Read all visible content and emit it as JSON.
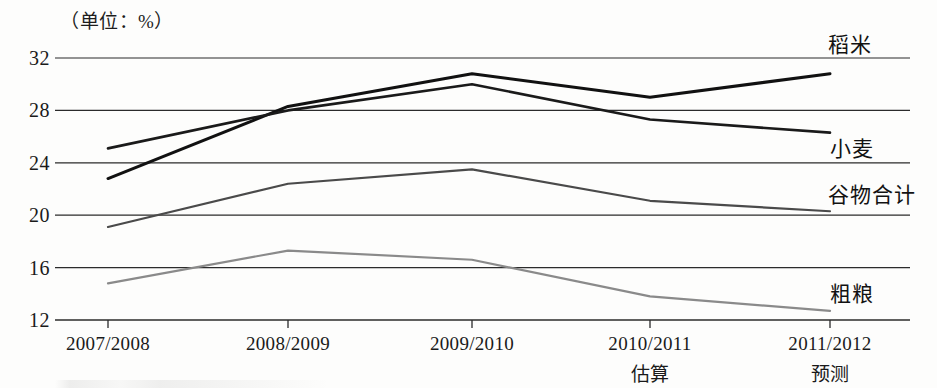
{
  "caption": "（单位：%）",
  "axes": {
    "y_ticks": [
      32,
      28,
      24,
      20,
      16,
      12
    ],
    "y_tick_labels": [
      "32",
      "28",
      "24",
      "20",
      "16",
      "12"
    ],
    "x_categories": [
      "2007/2008",
      "2008/2009",
      "2009/2010",
      "2010/2011",
      "2011/2012"
    ],
    "x_sublabels": [
      "",
      "",
      "",
      "估算",
      "预测"
    ]
  },
  "series_labels": {
    "rice": "稻米",
    "wheat": "小麦",
    "grain_total": "谷物合计",
    "coarse_grain": "粗粮"
  },
  "colors": {
    "rice": "#111111",
    "wheat": "#1a1a1a",
    "grain_total": "#4a4a4a",
    "coarse_grain": "#8a8a8a",
    "gridline": "#2b2b2b",
    "text": "#1a1a1a",
    "background": "#fdfdfc"
  },
  "chart_data": {
    "type": "line",
    "title": "",
    "subtitle": "（单位：%）",
    "xlabel": "",
    "ylabel": "",
    "unit": "%",
    "ylim": [
      12,
      32
    ],
    "yticks": [
      12,
      16,
      20,
      24,
      28,
      32
    ],
    "grid": true,
    "legend_position": "right-inline",
    "categories": [
      "2007/2008",
      "2008/2009",
      "2009/2010",
      "2010/2011",
      "2011/2012"
    ],
    "series": [
      {
        "name": "稻米",
        "values": [
          22.8,
          28.3,
          30.8,
          29.0,
          30.8
        ]
      },
      {
        "name": "小麦",
        "values": [
          25.1,
          28.0,
          30.0,
          27.3,
          26.3
        ]
      },
      {
        "name": "谷物合计",
        "values": [
          19.1,
          22.4,
          23.5,
          21.1,
          20.3
        ]
      },
      {
        "name": "粗粮",
        "values": [
          14.8,
          17.3,
          16.6,
          13.8,
          12.7
        ]
      }
    ],
    "annotations": [
      {
        "text": "估算",
        "category": "2010/2011"
      },
      {
        "text": "预测",
        "category": "2011/2012"
      }
    ]
  }
}
